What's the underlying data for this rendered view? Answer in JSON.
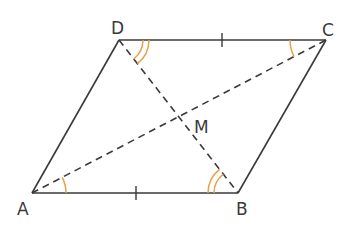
{
  "diagram": {
    "type": "parallelogram",
    "colors": {
      "line": "#3a3a3a",
      "angle_mark": "#e8a04a",
      "background": "#ffffff"
    },
    "vertices": {
      "A": {
        "label": "A",
        "x": 32,
        "y": 193
      },
      "B": {
        "label": "B",
        "x": 238,
        "y": 193
      },
      "C": {
        "label": "C",
        "x": 326,
        "y": 40
      },
      "D": {
        "label": "D",
        "x": 119,
        "y": 40
      }
    },
    "center": {
      "label": "M",
      "x": 179,
      "y": 116
    },
    "sides": [
      "AB",
      "BC",
      "CD",
      "DA"
    ],
    "diagonals": [
      {
        "from": "A",
        "to": "C",
        "style": "dashed"
      },
      {
        "from": "D",
        "to": "B",
        "style": "dashed"
      }
    ],
    "equal_length_marks": [
      {
        "side": "AB",
        "ticks": 1
      },
      {
        "side": "DC",
        "ticks": 1
      }
    ],
    "angle_marks": [
      {
        "vertex": "A",
        "between": "AB-AC",
        "arcs": 1
      },
      {
        "vertex": "C",
        "between": "CD-CA",
        "arcs": 1
      },
      {
        "vertex": "D",
        "between": "DC-DB",
        "arcs": 2
      },
      {
        "vertex": "B",
        "between": "BA-BD",
        "arcs": 2
      }
    ]
  }
}
